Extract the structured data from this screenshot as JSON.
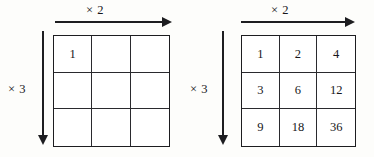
{
  "figure": {
    "type": "multiplication-grid-diagram",
    "line_color": "#1d1d20",
    "background_color": "#fdfdfb",
    "panel_count": 2
  },
  "panels": [
    {
      "id": "left",
      "name": "empty-grid-with-seed",
      "column_arrow_label": "× 2",
      "row_arrow_label": "× 3",
      "rows": 3,
      "columns": 3,
      "cells": [
        [
          "1",
          "",
          ""
        ],
        [
          "",
          "",
          ""
        ],
        [
          "",
          "",
          ""
        ]
      ]
    },
    {
      "id": "right",
      "name": "filled-grid",
      "column_arrow_label": "× 2",
      "row_arrow_label": "× 3",
      "rows": 3,
      "columns": 3,
      "cells": [
        [
          "1",
          "2",
          "4"
        ],
        [
          "3",
          "6",
          "12"
        ],
        [
          "9",
          "18",
          "36"
        ]
      ]
    }
  ]
}
